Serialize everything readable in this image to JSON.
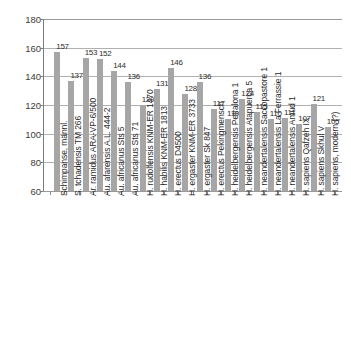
{
  "chart_data": {
    "type": "bar",
    "title": "",
    "xlabel": "",
    "ylabel": "",
    "ylim": [
      60,
      180
    ],
    "ytick_step": 20,
    "yticks": [
      180,
      160,
      140,
      120,
      100,
      80,
      60
    ],
    "grid": "horizontal",
    "legend": "none",
    "bar_color": "#a6a6a6",
    "categories": [
      "Schimpanse, männl.",
      "S. tchadensis TM 266",
      "Ar. ramidus ARA-VP-6/500",
      "Au. afarensis A.L. 444-2",
      "Au. africanus Sts 5",
      "Au. africanus Sts 71",
      "H. rudolfensis KNM-ER 1470",
      "H. habilis KNM-ER 1813",
      "H. erectus D4500",
      "H. ergaster KNM-ER 3733",
      "H. ergaster Sk 847",
      "H. erectus Pekingmensch",
      "H. heidelbergensis Petralona 1",
      "H. heidelbergensis Atapuerca 5",
      "H. neandertalensis Saccopastore 1",
      "H. neandertalensis La Ferrassie 1",
      "H. neandertalensis Amud 1",
      "H. sapiens Qafzeh IX",
      "H. sapiens Skhul V",
      "H. sapiens, modern (?)"
    ],
    "values": [
      157,
      137,
      153,
      152,
      144,
      136,
      120,
      131,
      146,
      128,
      136,
      117,
      110,
      124,
      115,
      110,
      111,
      107,
      121,
      105
    ]
  }
}
